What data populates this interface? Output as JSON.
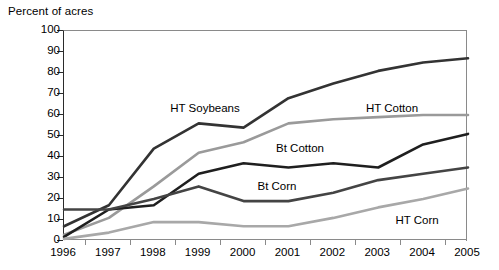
{
  "chart_data": {
    "type": "line",
    "title": "",
    "ylabel": "Percent of acres",
    "xlabel": "",
    "ylim": [
      0,
      100
    ],
    "ytick_step": 10,
    "yticks": [
      0,
      10,
      20,
      30,
      40,
      50,
      60,
      70,
      80,
      90,
      100
    ],
    "grid": false,
    "legend_position": "inline-annotations",
    "categories": [
      1996,
      1997,
      1998,
      1999,
      2000,
      2001,
      2002,
      2003,
      2004,
      2005
    ],
    "xtick_labels": [
      "1996",
      "1997",
      "1998",
      "1999",
      "2000",
      "2001",
      "2002",
      "2003",
      "2004",
      "2005"
    ],
    "series": [
      {
        "name": "HT Soybeans",
        "color": "#333333",
        "width": 2.6,
        "values": [
          7,
          17,
          44,
          56,
          54,
          68,
          75,
          81,
          85,
          87
        ],
        "label_x": 205,
        "label_y": 102
      },
      {
        "name": "HT Cotton",
        "color": "#9a9a9a",
        "width": 2.6,
        "values": [
          3,
          11,
          26,
          42,
          47,
          56,
          58,
          59,
          60,
          60
        ],
        "label_x": 392,
        "label_y": 102
      },
      {
        "name": "Bt Cotton",
        "color": "#1f1f1f",
        "width": 2.6,
        "values": [
          2,
          15,
          17,
          32,
          37,
          35,
          37,
          35,
          46,
          51
        ],
        "label_x": 300,
        "label_y": 142
      },
      {
        "name": "Bt Corn",
        "color": "#444444",
        "width": 2.6,
        "values": [
          15,
          15,
          20,
          26,
          19,
          19,
          23,
          29,
          32,
          35
        ],
        "label_x": 277,
        "label_y": 180
      },
      {
        "name": "HT Corn",
        "color": "#a8a8a8",
        "width": 2.6,
        "values": [
          1,
          4,
          9,
          9,
          7,
          7,
          11,
          16,
          20,
          25
        ],
        "label_x": 417,
        "label_y": 214
      }
    ]
  }
}
